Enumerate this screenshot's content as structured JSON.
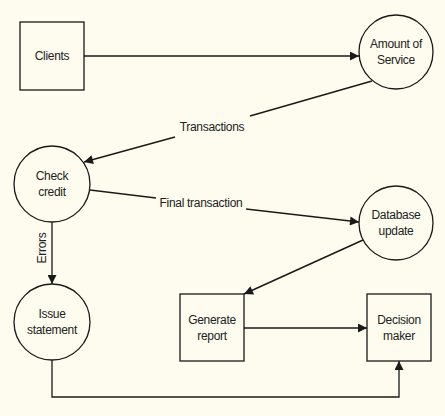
{
  "diagram": {
    "type": "data-flow-diagram",
    "colors": {
      "background": "#fdfcee",
      "stroke": "#1a1a1a",
      "text": "#222222"
    },
    "nodes": [
      {
        "id": "clients",
        "shape": "rectangle",
        "line1": "Clients",
        "line2": ""
      },
      {
        "id": "amount_of_service",
        "shape": "circle",
        "line1": "Amount of",
        "line2": "Service"
      },
      {
        "id": "check_credit",
        "shape": "circle",
        "line1": "Check",
        "line2": "credit"
      },
      {
        "id": "database_update",
        "shape": "circle",
        "line1": "Database",
        "line2": "update"
      },
      {
        "id": "issue_statement",
        "shape": "circle",
        "line1": "Issue",
        "line2": "statement"
      },
      {
        "id": "generate_report",
        "shape": "rectangle",
        "line1": "Generate",
        "line2": "report"
      },
      {
        "id": "decision_maker",
        "shape": "rectangle",
        "line1": "Decision",
        "line2": "maker"
      }
    ],
    "edges": [
      {
        "from": "clients",
        "to": "amount_of_service",
        "label": ""
      },
      {
        "from": "amount_of_service",
        "to": "check_credit",
        "label": "Transactions"
      },
      {
        "from": "check_credit",
        "to": "database_update",
        "label": "Final transaction"
      },
      {
        "from": "check_credit",
        "to": "issue_statement",
        "label": "Errors"
      },
      {
        "from": "database_update",
        "to": "generate_report",
        "label": ""
      },
      {
        "from": "generate_report",
        "to": "decision_maker",
        "label": ""
      },
      {
        "from": "issue_statement",
        "to": "decision_maker",
        "label": ""
      }
    ]
  }
}
